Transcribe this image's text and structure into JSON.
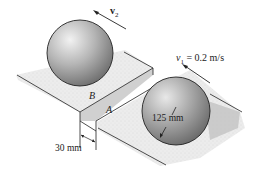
{
  "diagram": {
    "type": "mechanics-problem-figure",
    "spheres": [
      {
        "id": "upper-sphere",
        "velocity_label": "v",
        "velocity_sub": "2",
        "on_step": "B"
      },
      {
        "id": "lower-sphere",
        "velocity_label": "v",
        "velocity_sub": "1",
        "velocity_value": " = 0.2 m/s",
        "radius_label": "125 mm",
        "on_step": "A"
      }
    ],
    "points": {
      "upper_edge": "B",
      "lower_edge": "A"
    },
    "dimensions": {
      "step_height": "30 mm",
      "radius": "125 mm"
    },
    "colors": {
      "sphere_light": "#e6e6e6",
      "sphere_dark": "#7a7a7a",
      "surface": "#e9e9e9",
      "line": "#222222"
    }
  }
}
